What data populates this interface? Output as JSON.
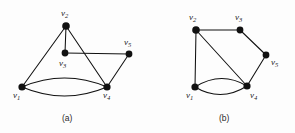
{
  "figure": {
    "background_color": "#fdfdfd",
    "ink_color": "#111111",
    "panels": [
      {
        "id": "panel-a",
        "caption": "(a)",
        "caption_pos": {
          "x": 62,
          "y": 114
        },
        "vertices": [
          {
            "id": "v1",
            "label_v": "v",
            "label_sub": "1",
            "x": 22,
            "y": 87,
            "r": 3.6,
            "label_x": 13,
            "label_y": 91
          },
          {
            "id": "v2",
            "label_v": "v",
            "label_sub": "2",
            "x": 66,
            "y": 26,
            "r": 3.8,
            "label_x": 61,
            "label_y": 9
          },
          {
            "id": "v3",
            "label_v": "v",
            "label_sub": "3",
            "x": 65,
            "y": 53,
            "r": 3.4,
            "label_x": 59,
            "label_y": 59
          },
          {
            "id": "v4",
            "label_v": "v",
            "label_sub": "4",
            "x": 107,
            "y": 87,
            "r": 3.6,
            "label_x": 103,
            "label_y": 91
          },
          {
            "id": "v5",
            "label_v": "v",
            "label_sub": "5",
            "x": 129,
            "y": 54,
            "r": 3.4,
            "label_x": 124,
            "label_y": 38
          }
        ],
        "edges": [
          {
            "from": "v2",
            "to": "v1",
            "kind": "straight"
          },
          {
            "from": "v2",
            "to": "v3",
            "kind": "straight"
          },
          {
            "from": "v2",
            "to": "v4",
            "kind": "straight"
          },
          {
            "from": "v3",
            "to": "v5",
            "kind": "straight"
          },
          {
            "from": "v5",
            "to": "v4",
            "kind": "straight"
          },
          {
            "from": "v1",
            "to": "v4",
            "kind": "curve-up",
            "bow": 9
          },
          {
            "from": "v1",
            "to": "v4",
            "kind": "curve-down",
            "bow": 9
          }
        ]
      },
      {
        "id": "panel-b",
        "caption": "(b)",
        "caption_pos": {
          "x": 219,
          "y": 114
        },
        "vertices": [
          {
            "id": "v1",
            "label_v": "v",
            "label_sub": "1",
            "x": 195,
            "y": 87,
            "r": 3.6,
            "label_x": 186,
            "label_y": 91
          },
          {
            "id": "v2",
            "label_v": "v",
            "label_sub": "2",
            "x": 196,
            "y": 30,
            "r": 3.8,
            "label_x": 189,
            "label_y": 13
          },
          {
            "id": "v3",
            "label_v": "v",
            "label_sub": "3",
            "x": 240,
            "y": 30,
            "r": 3.4,
            "label_x": 235,
            "label_y": 13
          },
          {
            "id": "v4",
            "label_v": "v",
            "label_sub": "4",
            "x": 247,
            "y": 86,
            "r": 3.6,
            "label_x": 250,
            "label_y": 91
          },
          {
            "id": "v5",
            "label_v": "v",
            "label_sub": "5",
            "x": 266,
            "y": 55,
            "r": 3.4,
            "label_x": 271,
            "label_y": 58
          }
        ],
        "edges": [
          {
            "from": "v2",
            "to": "v3",
            "kind": "straight"
          },
          {
            "from": "v3",
            "to": "v5",
            "kind": "straight"
          },
          {
            "from": "v5",
            "to": "v4",
            "kind": "straight"
          },
          {
            "from": "v2",
            "to": "v1",
            "kind": "straight"
          },
          {
            "from": "v2",
            "to": "v4",
            "kind": "straight"
          },
          {
            "from": "v1",
            "to": "v4",
            "kind": "curve-up",
            "bow": 8
          },
          {
            "from": "v1",
            "to": "v4",
            "kind": "curve-down",
            "bow": 8
          }
        ]
      }
    ]
  },
  "chart_data": {
    "type": "diagram",
    "title": "",
    "graphs": [
      {
        "name": "(a)",
        "nodes": [
          "v1",
          "v2",
          "v3",
          "v4",
          "v5"
        ],
        "edges": [
          [
            "v1",
            "v2"
          ],
          [
            "v2",
            "v3"
          ],
          [
            "v2",
            "v4"
          ],
          [
            "v3",
            "v5"
          ],
          [
            "v4",
            "v5"
          ],
          [
            "v1",
            "v4"
          ],
          [
            "v1",
            "v4"
          ]
        ],
        "degrees": {
          "v1": 3,
          "v2": 3,
          "v3": 2,
          "v4": 4,
          "v5": 2
        }
      },
      {
        "name": "(b)",
        "nodes": [
          "v1",
          "v2",
          "v3",
          "v4",
          "v5"
        ],
        "edges": [
          [
            "v2",
            "v3"
          ],
          [
            "v3",
            "v5"
          ],
          [
            "v4",
            "v5"
          ],
          [
            "v1",
            "v2"
          ],
          [
            "v2",
            "v4"
          ],
          [
            "v1",
            "v4"
          ],
          [
            "v1",
            "v4"
          ]
        ],
        "degrees": {
          "v1": 3,
          "v2": 3,
          "v3": 2,
          "v4": 4,
          "v5": 2
        }
      }
    ]
  }
}
